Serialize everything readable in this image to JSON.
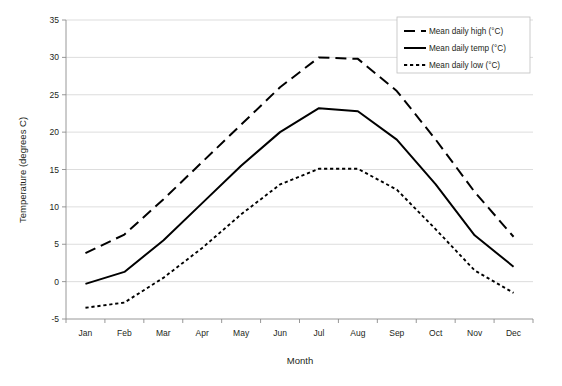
{
  "chart_data": {
    "type": "line",
    "title": "",
    "xlabel": "Month",
    "ylabel": "Temperature (degrees C)",
    "categories": [
      "Jan",
      "Feb",
      "Mar",
      "Apr",
      "May",
      "Jun",
      "Jul",
      "Aug",
      "Sep",
      "Oct",
      "Nov",
      "Dec"
    ],
    "ylim": [
      -5,
      35
    ],
    "yticks": [
      -5,
      0,
      5,
      10,
      15,
      20,
      25,
      30,
      35
    ],
    "ytick_labels": [
      "-5",
      "0",
      "5",
      "10",
      "15",
      "20",
      "25",
      "30",
      "35"
    ],
    "grid": true,
    "legend_position": "top-right",
    "series": [
      {
        "name": "Mean daily high (°C)",
        "style": "dashed",
        "color": "#000000",
        "values": [
          3.8,
          6.3,
          11.0,
          16.0,
          21.0,
          26.0,
          30.0,
          29.8,
          25.5,
          19.0,
          12.0,
          6.0
        ]
      },
      {
        "name": "Mean daily temp (°C)",
        "style": "solid",
        "color": "#000000",
        "values": [
          -0.3,
          1.3,
          5.5,
          10.5,
          15.5,
          20.0,
          23.2,
          22.8,
          19.0,
          13.0,
          6.2,
          2.0
        ]
      },
      {
        "name": "Mean daily low (°C)",
        "style": "dotted",
        "color": "#000000",
        "values": [
          -3.5,
          -2.8,
          0.5,
          4.5,
          9.0,
          13.0,
          15.1,
          15.1,
          12.3,
          7.0,
          1.5,
          -1.5
        ]
      }
    ]
  },
  "legend": {
    "entries": [
      {
        "label": "Mean daily high (°C)"
      },
      {
        "label": "Mean daily temp (°C)"
      },
      {
        "label": "Mean daily low (°C)"
      }
    ]
  },
  "caption": {
    "text": ""
  }
}
